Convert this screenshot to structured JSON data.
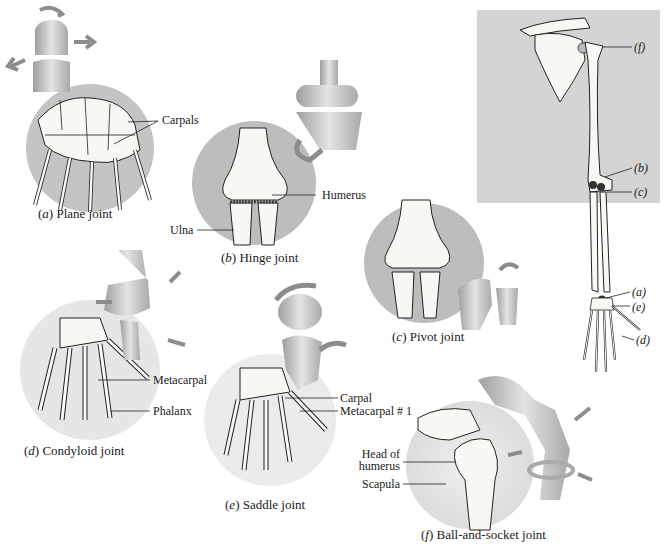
{
  "figure": {
    "panels": [
      {
        "id": "a",
        "letter": "a",
        "name": "Plane joint",
        "labels": [
          "Carpals"
        ]
      },
      {
        "id": "b",
        "letter": "b",
        "name": "Hinge joint",
        "labels": [
          "Humerus",
          "Ulna"
        ]
      },
      {
        "id": "c",
        "letter": "c",
        "name": "Pivot joint",
        "labels": []
      },
      {
        "id": "d",
        "letter": "d",
        "name": "Condyloid joint",
        "labels": [
          "Metacarpal",
          "Phalanx"
        ]
      },
      {
        "id": "e",
        "letter": "e",
        "name": "Saddle joint",
        "labels": [
          "Carpal",
          "Metacarpal # 1"
        ]
      },
      {
        "id": "f",
        "letter": "f",
        "name": "Ball-and-socket joint",
        "labels": [
          "Head of",
          "humerus",
          "Scapula"
        ]
      }
    ],
    "skeleton_key": {
      "labels": [
        "(f)",
        "(b)",
        "(c)",
        "(a)",
        "(e)",
        "(d)"
      ]
    }
  },
  "colors": {
    "disc": "#bdbdbd",
    "disc_light": "#e6e6e6",
    "key_bg": "#d4d4d4",
    "bone": "#f7f7f4",
    "model": "#c9c9c9",
    "arrow": "#8c8c8c",
    "ink": "#1a1a1a"
  }
}
